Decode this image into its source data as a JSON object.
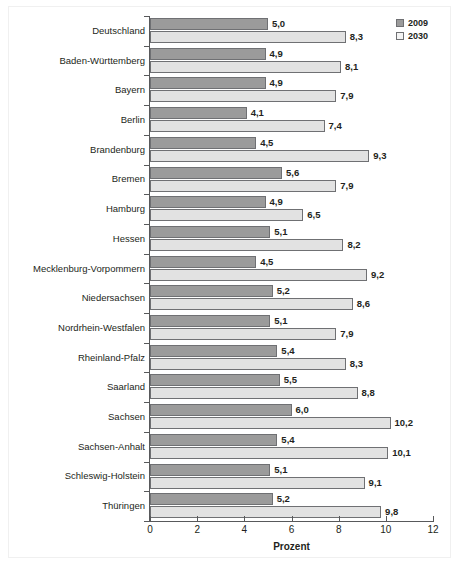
{
  "chart_data": {
    "type": "bar",
    "orientation": "horizontal",
    "title": "",
    "xlabel": "Prozent",
    "ylabel": "",
    "xlim": [
      0,
      12
    ],
    "xticks": [
      "0",
      "2",
      "4",
      "6",
      "8",
      "10",
      "12"
    ],
    "grid": false,
    "legend_position": "top-right",
    "categories": [
      "Deutschland",
      "Baden-Württemberg",
      "Bayern",
      "Berlin",
      "Brandenburg",
      "Bremen",
      "Hamburg",
      "Hessen",
      "Mecklenburg-Vorpommern",
      "Niedersachsen",
      "Nordrhein-Westfalen",
      "Rheinland-Pfalz",
      "Saarland",
      "Sachsen",
      "Sachsen-Anhalt",
      "Schleswig-Holstein",
      "Thüringen"
    ],
    "series": [
      {
        "name": "2009",
        "color": "#9b9b9b",
        "values": [
          5.0,
          4.9,
          4.9,
          4.1,
          4.5,
          5.6,
          4.9,
          5.1,
          4.5,
          5.2,
          5.1,
          5.4,
          5.5,
          6.0,
          5.4,
          5.1,
          5.2
        ],
        "labels": [
          "5,0",
          "4,9",
          "4,9",
          "4,1",
          "4,5",
          "5,6",
          "4,9",
          "5,1",
          "4,5",
          "5,2",
          "5,1",
          "5,4",
          "5,5",
          "6,0",
          "5,4",
          "5,1",
          "5,2"
        ]
      },
      {
        "name": "2030",
        "color": "#e2e2e2",
        "values": [
          8.3,
          8.1,
          7.9,
          7.4,
          9.3,
          7.9,
          6.5,
          8.2,
          9.2,
          8.6,
          7.9,
          8.3,
          8.8,
          10.2,
          10.1,
          9.1,
          9.8
        ],
        "labels": [
          "8,3",
          "8,1",
          "7,9",
          "7,4",
          "9,3",
          "7,9",
          "6,5",
          "8,2",
          "9,2",
          "8,6",
          "7,9",
          "8,3",
          "8,8",
          "10,2",
          "10,1",
          "9,1",
          "9,8"
        ]
      }
    ]
  },
  "legend": {
    "items": [
      {
        "label": "2009",
        "color": "#9b9b9b"
      },
      {
        "label": "2030",
        "color": "#f4f4f4"
      }
    ]
  },
  "axis": {
    "x_title": "Prozent"
  }
}
